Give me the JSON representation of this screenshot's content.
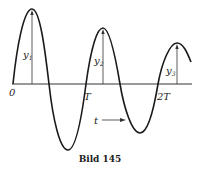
{
  "figure": {
    "caption": "Bild 145",
    "origin_label": "0",
    "period_labels": [
      "T",
      "2T"
    ],
    "time_label": "t",
    "amplitude_labels": [
      "y1",
      "y2",
      "y3"
    ],
    "amplitude_sub": [
      "1",
      "2",
      "3"
    ],
    "curve_color": "#1a1a1a",
    "axis_color": "#333333"
  }
}
